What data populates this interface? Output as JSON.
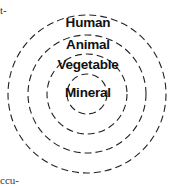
{
  "fragments": {
    "top_left": "t-",
    "bottom_left": "ccu-"
  },
  "diagram": {
    "type": "concentric-circles",
    "style": "dashed",
    "rings": [
      {
        "label": "Human",
        "level": 4
      },
      {
        "label": "Animal",
        "level": 3
      },
      {
        "label": "Vegetable",
        "level": 2
      },
      {
        "label": "Mineral",
        "level": 1
      }
    ]
  }
}
